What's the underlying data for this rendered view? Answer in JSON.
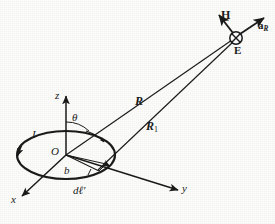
{
  "figure": {
    "background_color": "#fdfdfc",
    "ink_color": "#1b1b1b",
    "axes": [
      {
        "name": "x",
        "label": "x",
        "style": "italic"
      },
      {
        "name": "y",
        "label": "y",
        "style": "italic"
      },
      {
        "name": "z",
        "label": "z",
        "style": "italic"
      }
    ],
    "points": [
      {
        "name": "origin",
        "label": "O",
        "style": "italic"
      },
      {
        "name": "field-point",
        "label": "E",
        "style": "bold"
      }
    ],
    "lengths": [
      {
        "name": "loop-radius",
        "label": "b",
        "style": "italic"
      },
      {
        "name": "distance-R",
        "label": "R",
        "style": "bold-italic"
      },
      {
        "name": "distance-R1",
        "label": "R",
        "sub": "1",
        "style": "bold-italic"
      }
    ],
    "angles": [
      {
        "name": "theta-angle",
        "label": "θ",
        "style": "italic"
      }
    ],
    "vectors": [
      {
        "name": "magnetic-field-vector",
        "label": "H",
        "style": "bold"
      },
      {
        "name": "unit-vector-aR",
        "label": "a",
        "sub": "R",
        "style": "bold"
      }
    ],
    "source": [
      {
        "name": "loop-current",
        "label": "I",
        "style": "italic"
      },
      {
        "name": "differential-length",
        "label": "dℓ′",
        "style": "italic"
      }
    ],
    "markers": [
      {
        "name": "into-page-marker",
        "symbol": "⊗",
        "at": "E"
      },
      {
        "name": "current-direction-arrow",
        "symbol": "→",
        "at": "loop"
      }
    ]
  }
}
